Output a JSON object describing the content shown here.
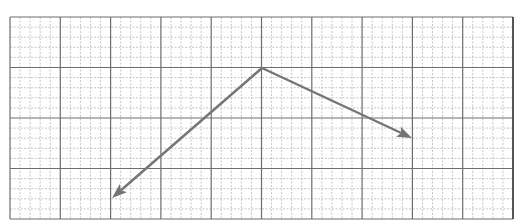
{
  "diagram": {
    "type": "vector-diagram-on-grid-paper",
    "grid": {
      "origin_px": [
        10,
        17
      ],
      "width_px": 503,
      "height_px": 202,
      "minor_spacing_px": 10.06,
      "major_every": 5,
      "minor_color": "#b8b8b8",
      "major_color": "#6e6e6e"
    },
    "vectors": [
      {
        "name": "vector-left",
        "start_px": [
          262,
          68
        ],
        "end_px": [
          112,
          198
        ],
        "color": "#757575",
        "direction": "down-left"
      },
      {
        "name": "vector-right",
        "start_px": [
          262,
          68
        ],
        "end_px": [
          412,
          138
        ],
        "color": "#757575",
        "direction": "down-right"
      }
    ],
    "common_origin_px": [
      262,
      68
    ]
  }
}
